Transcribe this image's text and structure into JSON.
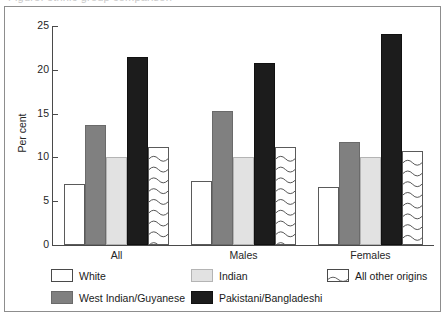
{
  "figure": {
    "cut_off_heading": "Figure: ethnic group comparison",
    "y_axis_title": "Per cent"
  },
  "chart_data": {
    "type": "bar",
    "title": "",
    "xlabel": "",
    "ylabel": "Per cent",
    "ylim": [
      0,
      25
    ],
    "yticks": [
      "0",
      "5",
      "10",
      "15",
      "20",
      "25"
    ],
    "ytick_values": [
      0,
      5,
      10,
      15,
      20,
      25
    ],
    "grid": false,
    "legend_position": "bottom",
    "categories": [
      "All",
      "Males",
      "Females"
    ],
    "series": [
      {
        "name": "White",
        "fill": "white",
        "color": "#ffffff",
        "values": [
          7.0,
          7.3,
          6.6
        ]
      },
      {
        "name": "West Indian/Guyanese",
        "fill": "dark-gray",
        "color": "#808080",
        "values": [
          13.7,
          15.3,
          11.8
        ]
      },
      {
        "name": "Indian",
        "fill": "light-gray",
        "color": "#e2e2e2",
        "values": [
          10.1,
          10.1,
          10.1
        ]
      },
      {
        "name": "Pakistani/Bangladeshi",
        "fill": "black",
        "color": "#1c1c1c",
        "values": [
          21.5,
          20.8,
          24.1
        ]
      },
      {
        "name": "All other origins",
        "fill": "wavy",
        "color": "#ffffff",
        "values": [
          11.2,
          11.2,
          10.7
        ]
      }
    ]
  },
  "legend": {
    "items": [
      {
        "label": "White",
        "swatch": "white"
      },
      {
        "label": "Indian",
        "swatch": "lgray"
      },
      {
        "label": "All other origins",
        "swatch": "wavy"
      },
      {
        "label": "West Indian/Guyanese",
        "swatch": "dgray"
      },
      {
        "label": "Pakistani/Bangladeshi",
        "swatch": "black"
      }
    ]
  }
}
